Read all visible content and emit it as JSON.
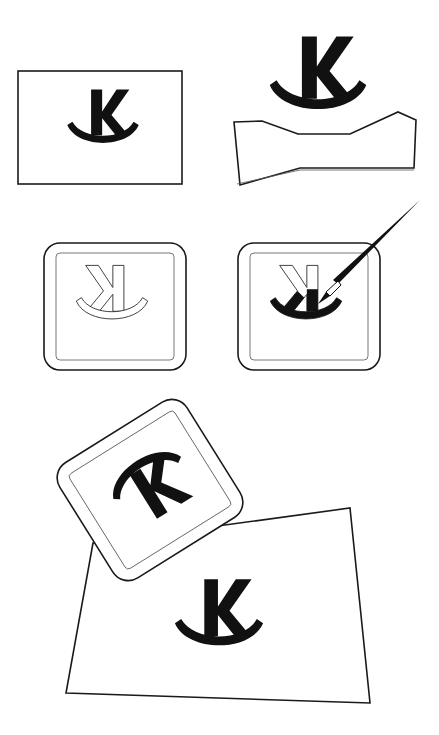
{
  "diagram": {
    "type": "process-illustration",
    "logo": {
      "glyph": "K",
      "mark": "smile-arc"
    },
    "steps": [
      {
        "id": 1,
        "name": "logo-artwork",
        "description": "Logo drawn on a rectangular sheet"
      },
      {
        "id": 2,
        "name": "logo-raised-from-sheet",
        "description": "Logo lifted off a curled sheet"
      },
      {
        "id": 3,
        "name": "mirrored-logo-on-stamp",
        "description": "Mirrored outline logo on a stamp block"
      },
      {
        "id": 4,
        "name": "inking-stamp",
        "description": "Paintbrush inking the mirrored logo on the stamp"
      },
      {
        "id": 5,
        "name": "stamping-paper",
        "description": "Tilted stamp above paper with printed logo"
      }
    ],
    "colors": {
      "ink": "#111111",
      "line": "#1a1a1a",
      "paper": "#ffffff"
    }
  }
}
